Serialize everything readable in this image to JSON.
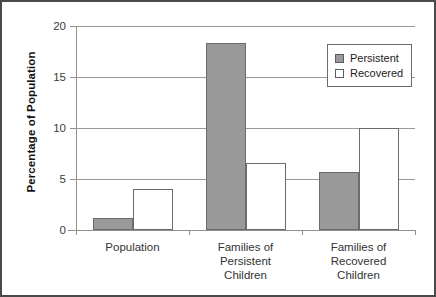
{
  "chart_data": {
    "type": "bar",
    "title": "",
    "xlabel": "",
    "ylabel": "Percentage of Population",
    "ylim": [
      0,
      20
    ],
    "yticks": [
      0,
      5,
      10,
      15,
      20
    ],
    "ytick_labels": [
      "0",
      "5",
      "10",
      "15",
      "20"
    ],
    "grid": true,
    "grid_axis": "y",
    "legend_position": "top-right",
    "categories": [
      "Population",
      "Families of\nPersistent\nChildren",
      "Families of\nRecovered\nChildren"
    ],
    "series": [
      {
        "name": "Persistent",
        "color": "#999999",
        "values": [
          1.2,
          18.3,
          5.7
        ]
      },
      {
        "name": "Recovered",
        "color": "#ffffff",
        "values": [
          4.0,
          6.6,
          10.0
        ]
      }
    ]
  },
  "legend": {
    "items": [
      {
        "label": "Persistent",
        "swatch": "persistent"
      },
      {
        "label": "Recovered",
        "swatch": "recovered"
      }
    ]
  },
  "colors": {
    "persistent_fill": "#999999",
    "recovered_fill": "#ffffff",
    "bar_edge": "#6b6b6b",
    "gridline": "#9a9a9a",
    "axis": "#8f8f8f",
    "frame": "#4a4a4a",
    "text": "#333333"
  }
}
